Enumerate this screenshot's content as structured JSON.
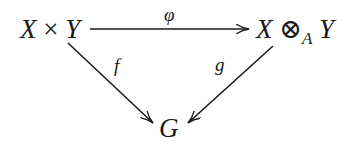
{
  "diagram": {
    "type": "commutative-diagram",
    "nodes": {
      "top_left": {
        "parts": [
          "X",
          "×",
          "Y"
        ],
        "text": "X × Y"
      },
      "top_right": {
        "parts": [
          "X",
          "⊗",
          "A",
          "Y"
        ],
        "text": "X ⊗_A Y"
      },
      "bottom": {
        "text": "G"
      }
    },
    "arrows": {
      "top": {
        "label": "φ",
        "from": "X × Y",
        "to": "X ⊗_A Y"
      },
      "left": {
        "label": "f",
        "from": "X × Y",
        "to": "G"
      },
      "right": {
        "label": "g",
        "from": "X ⊗_A Y",
        "to": "G"
      }
    },
    "colors": {
      "ink": "#1a1a1a",
      "background": "#ffffff"
    }
  }
}
